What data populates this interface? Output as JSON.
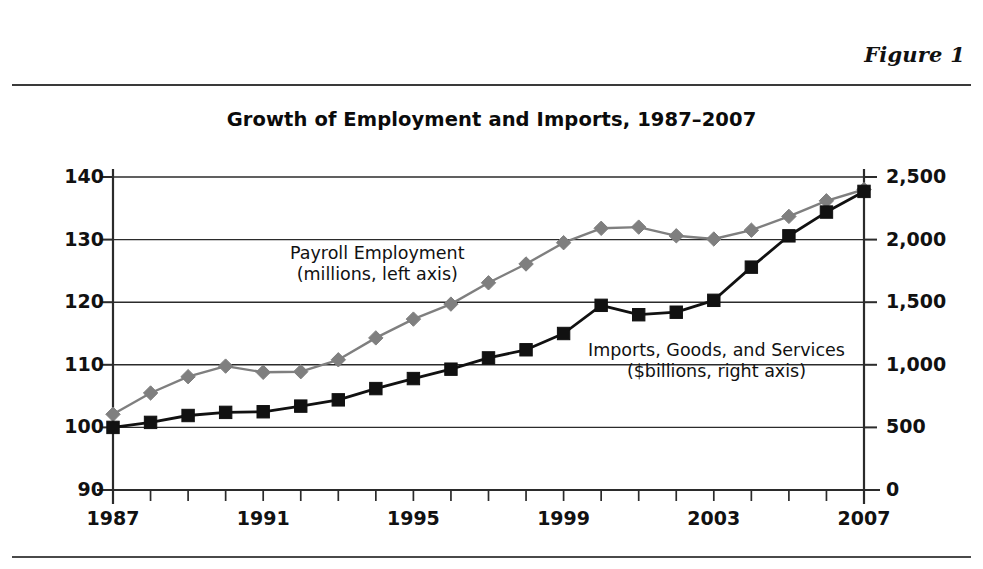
{
  "header": {
    "figure_label": "Figure 1"
  },
  "chart_data": {
    "type": "line",
    "title": "Growth of Employment and Imports, 1987–2007",
    "xlabel": "",
    "ylabel": "",
    "grid": true,
    "legend_position": "inline-annotation",
    "x": [
      1987,
      1988,
      1989,
      1990,
      1991,
      1992,
      1993,
      1994,
      1995,
      1996,
      1997,
      1998,
      1999,
      2000,
      2001,
      2002,
      2003,
      2004,
      2005,
      2006,
      2007
    ],
    "xtick_labels": [
      "1987",
      "1991",
      "1995",
      "1999",
      "2003",
      "2007"
    ],
    "xtick_values": [
      1987,
      1991,
      1995,
      1999,
      2003,
      2007
    ],
    "xlim": [
      1987,
      2007
    ],
    "left_axis": {
      "label": "Payroll Employment (millions, left axis)",
      "ticks": [
        90,
        100,
        110,
        120,
        130,
        140
      ],
      "tick_labels": [
        "90",
        "100",
        "110",
        "120",
        "130",
        "140"
      ],
      "ylim": [
        90,
        140
      ]
    },
    "right_axis": {
      "label": "Imports, Goods, and Services ($billions, right axis)",
      "ticks": [
        0,
        500,
        1000,
        1500,
        2000,
        2500
      ],
      "tick_labels": [
        "0",
        "500",
        "1,000",
        "1,500",
        "2,000",
        "2,500"
      ],
      "ylim": [
        0,
        2500
      ]
    },
    "series": [
      {
        "name": "Payroll Employment",
        "axis": "left",
        "units": "millions",
        "color": "#7f7f7f",
        "marker": "diamond",
        "annotation_line1": "Payroll Employment",
        "annotation_line2": "(millions, left axis)",
        "values": [
          102.1,
          105.5,
          108.1,
          109.8,
          108.8,
          108.9,
          110.8,
          114.3,
          117.3,
          119.7,
          123.1,
          126.1,
          129.5,
          131.8,
          132.0,
          130.6,
          130.1,
          131.5,
          133.7,
          136.2,
          138.0
        ]
      },
      {
        "name": "Imports, Goods, and Services",
        "axis": "right",
        "units": "$billions",
        "color": "#111111",
        "marker": "square",
        "annotation_line1": "Imports, Goods, and Services",
        "annotation_line2": "($billions, right axis)",
        "values_left_scale": [
          100.0,
          100.8,
          101.9,
          102.4,
          102.5,
          103.4,
          104.4,
          106.2,
          107.8,
          109.3,
          111.1,
          112.4,
          115.0,
          119.5,
          118.0,
          118.4,
          120.3,
          125.6,
          130.6,
          134.4,
          137.7
        ],
        "values": [
          500,
          540,
          595,
          620,
          625,
          670,
          720,
          810,
          890,
          965,
          1055,
          1120,
          1250,
          1475,
          1400,
          1420,
          1515,
          1780,
          2030,
          2220,
          2385
        ]
      }
    ]
  }
}
